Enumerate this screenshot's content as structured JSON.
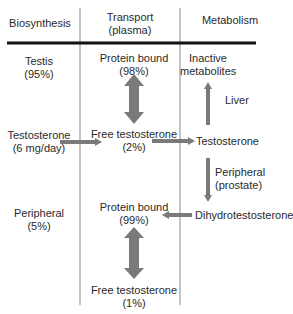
{
  "headers": {
    "biosynthesis": "Biosynthesis",
    "transport": [
      "Transport",
      "(plasma)"
    ],
    "metabolism": "Metabolism"
  },
  "biosynthesis": {
    "testis": [
      "Testis",
      "(95%)"
    ],
    "testosterone": [
      "Testosterone",
      "(6 mg/day)"
    ],
    "peripheral": [
      "Peripheral",
      "(5%)"
    ]
  },
  "transport": {
    "protein_bound_1": [
      "Protein bound",
      "(98%)"
    ],
    "free_1": [
      "Free testosterone",
      "(2%)"
    ],
    "protein_bound_2": [
      "Protein bound",
      "(99%)"
    ],
    "free_2": [
      "Free testosterone",
      "(1%)"
    ]
  },
  "metabolism": {
    "inactive": [
      "Inactive",
      "metabolites"
    ],
    "liver": "Liver",
    "testosterone": "Testosterone",
    "peripheral": [
      "Peripheral",
      "(prostate)"
    ],
    "dht": "Dihydrotestosterone"
  },
  "colors": {
    "arrow": "#7a7a7a",
    "line": "#777777",
    "rule": "#111111",
    "text": "#2a2a2a"
  }
}
